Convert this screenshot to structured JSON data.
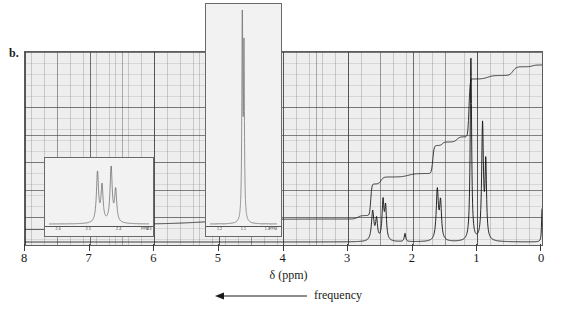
{
  "panel": {
    "label": "b."
  },
  "axis": {
    "caption": "δ (ppm)",
    "direction_label": "frequency",
    "direction_arrow": "left-arrow-icon",
    "ticks": [
      "8",
      "7",
      "6",
      "5",
      "4",
      "3",
      "2",
      "1",
      "0"
    ],
    "min_ppm": 0,
    "max_ppm": 8
  },
  "colors": {
    "plot_background": "#eeeeee",
    "grid_major": "#3c3c3c",
    "grid_minor": "#787878",
    "trace": "#1a1a1a",
    "frame": "#5c5c5c",
    "inset_background": "#f2f2f2"
  },
  "insets": {
    "expansion_low": {
      "name": "expansion-inset-2.4ppm",
      "unit_label": "PPM",
      "tick_labels": [
        "2.6",
        "2.5",
        "2.4",
        "2.3"
      ],
      "description": "Expansion of the multiplet centred near 2.45 ppm"
    },
    "expansion_high": {
      "name": "expansion-inset-1.1ppm",
      "unit_label": "PPM",
      "tick_labels": [
        "1.2",
        "1.1",
        "1.0"
      ],
      "description": "Expansion of the intense signal near 1.1 ppm"
    }
  },
  "chart_data": {
    "type": "line",
    "title": "",
    "xlabel": "δ (ppm)",
    "ylabel": "",
    "xlim": [
      8,
      0
    ],
    "grid": true,
    "legend": "none",
    "series": [
      {
        "name": "1H NMR spectrum",
        "peaks": [
          {
            "ppm": 2.62,
            "height": 0.16,
            "width": 0.022,
            "label": "multiplet"
          },
          {
            "ppm": 2.56,
            "height": 0.11,
            "width": 0.018,
            "label": "multiplet"
          },
          {
            "ppm": 2.46,
            "height": 0.21,
            "width": 0.018,
            "label": "multiplet"
          },
          {
            "ppm": 2.42,
            "height": 0.17,
            "width": 0.016,
            "label": "multiplet"
          },
          {
            "ppm": 2.12,
            "height": 0.045,
            "width": 0.013,
            "label": "small singlet"
          },
          {
            "ppm": 1.62,
            "height": 0.27,
            "width": 0.02,
            "label": "multiplet"
          },
          {
            "ppm": 1.57,
            "height": 0.2,
            "width": 0.018,
            "label": "multiplet"
          },
          {
            "ppm": 1.1,
            "height": 1.0,
            "width": 0.013,
            "label": "tall signal"
          },
          {
            "ppm": 0.92,
            "height": 0.62,
            "width": 0.016,
            "label": "tall signal"
          },
          {
            "ppm": 0.87,
            "height": 0.4,
            "width": 0.014,
            "label": "tall signal"
          },
          {
            "ppm": 0.0,
            "height": 0.18,
            "width": 0.008,
            "label": "TMS reference"
          }
        ]
      },
      {
        "name": "integration trace",
        "steps": [
          {
            "ppm": 8.0,
            "level": 0.02
          },
          {
            "ppm": 7.4,
            "level": 0.02
          },
          {
            "ppm": 7.3,
            "level": 0.05
          },
          {
            "ppm": 3.0,
            "level": 0.08
          },
          {
            "ppm": 2.7,
            "level": 0.1
          },
          {
            "ppm": 2.6,
            "level": 0.28
          },
          {
            "ppm": 2.38,
            "level": 0.32
          },
          {
            "ppm": 1.75,
            "level": 0.34
          },
          {
            "ppm": 1.63,
            "level": 0.5
          },
          {
            "ppm": 1.45,
            "level": 0.52
          },
          {
            "ppm": 1.18,
            "level": 0.55
          },
          {
            "ppm": 1.08,
            "level": 0.88
          },
          {
            "ppm": 0.6,
            "level": 0.9
          },
          {
            "ppm": 0.3,
            "level": 0.95
          },
          {
            "ppm": 0.0,
            "level": 0.96
          }
        ]
      }
    ],
    "inset_low_peaks": [
      {
        "ppm": 2.47,
        "height": 0.86
      },
      {
        "ppm": 2.455,
        "height": 0.62
      },
      {
        "ppm": 2.425,
        "height": 0.96
      },
      {
        "ppm": 2.41,
        "height": 0.55
      }
    ],
    "inset_high_peaks": [
      {
        "ppm": 1.105,
        "height": 1.0
      },
      {
        "ppm": 1.098,
        "height": 0.78
      }
    ]
  }
}
